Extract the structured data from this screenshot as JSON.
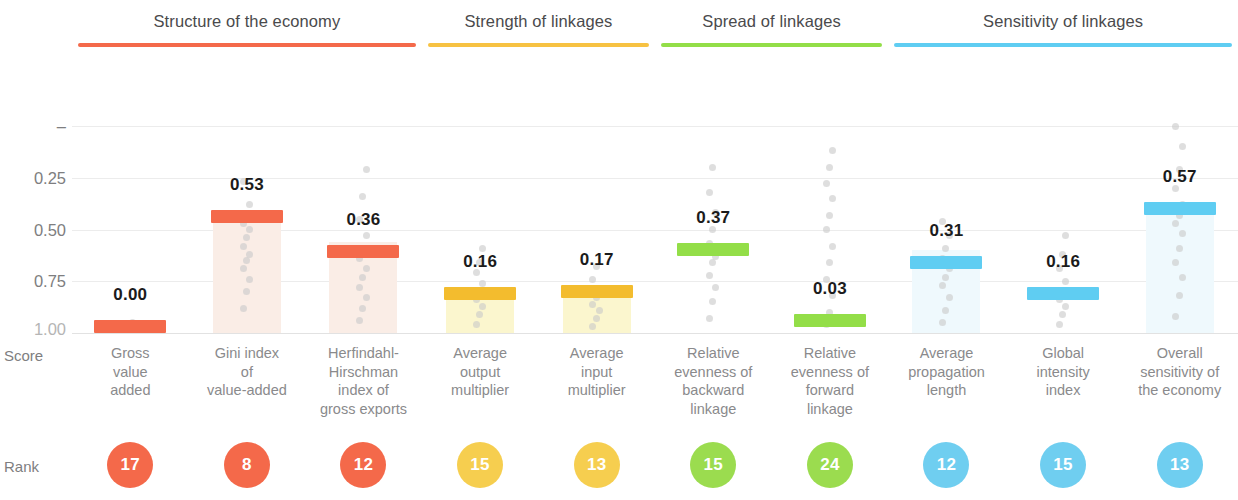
{
  "axis": {
    "score_caption": "Score",
    "rank_caption": "Rank",
    "yticks": [
      "1.00",
      "0.75",
      "0.50",
      "0.25",
      "–"
    ],
    "ytick_values": [
      1.0,
      0.75,
      0.5,
      0.25,
      0.0
    ]
  },
  "groups": [
    {
      "label": "Structure of the economy",
      "color": "#F4694A",
      "span": [
        0,
        2
      ]
    },
    {
      "label": "Strength of linkages",
      "color": "#F7C242",
      "span": [
        3,
        4
      ]
    },
    {
      "label": "Spread of linkages",
      "color": "#93DE48",
      "span": [
        5,
        6
      ]
    },
    {
      "label": "Sensitivity of linkages",
      "color": "#5FCDF2",
      "span": [
        7,
        9
      ]
    }
  ],
  "chart_data": {
    "type": "bar",
    "title": "",
    "xlabel": "",
    "ylabel": "Score",
    "ylim": [
      0,
      1.0
    ],
    "yticks": [
      0.0,
      0.25,
      0.5,
      0.75,
      1.0
    ],
    "grid": true,
    "legend": "none",
    "categories": [
      "Gross value added",
      "Gini index of value-added",
      "Herfindahl-Hirschman index of gross exports",
      "Average output multiplier",
      "Average input multiplier",
      "Relative evenness of backward linkage",
      "Relative evenness of forward linkage",
      "Average propagation length",
      "Global intensity index",
      "Overall sensitivity of the economy"
    ],
    "category_lines": [
      [
        "Gross",
        "value",
        "added"
      ],
      [
        "Gini index",
        "of",
        "value-added"
      ],
      [
        "Herfindahl-",
        "Hirschman",
        "index of",
        "gross exports"
      ],
      [
        "Average",
        "output",
        "multiplier"
      ],
      [
        "Average",
        "input",
        "multiplier"
      ],
      [
        "Relative",
        "evenness of",
        "backward",
        "linkage"
      ],
      [
        "Relative",
        "evenness of",
        "forward",
        "linkage"
      ],
      [
        "Average",
        "propagation",
        "length"
      ],
      [
        "Global",
        "intensity",
        "index"
      ],
      [
        "Overall",
        "sensitivity of",
        "the economy"
      ]
    ],
    "values": [
      0.0,
      0.53,
      0.36,
      0.16,
      0.17,
      0.37,
      0.03,
      0.31,
      0.16,
      0.57
    ],
    "value_labels": [
      "0.00",
      "0.53",
      "0.36",
      "0.16",
      "0.17",
      "0.37",
      "0.03",
      "0.31",
      "0.16",
      "0.57"
    ],
    "ranks": [
      17,
      8,
      12,
      15,
      13,
      15,
      24,
      12,
      15,
      13
    ],
    "rank_labels": [
      "17",
      "8",
      "12",
      "15",
      "13",
      "15",
      "24",
      "12",
      "15",
      "13"
    ],
    "bar_colors": [
      "#F4694A",
      "#F4694A",
      "#F4694A",
      "#F3BC2E",
      "#F3BC2E",
      "#93DE48",
      "#93DE48",
      "#5FCDF2",
      "#5FCDF2",
      "#5FCDF2"
    ],
    "rank_colors": [
      "#F4694A",
      "#F4694A",
      "#F4694A",
      "#F6CE4F",
      "#F6CE4F",
      "#9BDC4F",
      "#9BDC4F",
      "#6FCEF0",
      "#6FCEF0",
      "#6FCEF0"
    ],
    "box_fills": [
      "#FFFFFF",
      "#FAEDE6",
      "#FAEDE6",
      "#FBF6CE",
      "#FBF6CE",
      "#FFFFFF",
      "#FFFFFF",
      "#EFF9FD",
      "#FFFFFF",
      "#EFF9FD"
    ],
    "box_ranges": [
      [
        0.0,
        0.0
      ],
      [
        0.0,
        0.57
      ],
      [
        0.0,
        0.44
      ],
      [
        0.0,
        0.2
      ],
      [
        0.0,
        0.21
      ],
      [
        0.0,
        0.0
      ],
      [
        0.0,
        0.0
      ],
      [
        0.0,
        0.4
      ],
      [
        0.0,
        0.0
      ],
      [
        0.0,
        0.59
      ]
    ],
    "distributions": [
      [
        0.02,
        0.03,
        0.05
      ],
      [
        0.12,
        0.2,
        0.26,
        0.31,
        0.35,
        0.38,
        0.42,
        0.46,
        0.5,
        0.53,
        0.57,
        0.62,
        0.73
      ],
      [
        0.06,
        0.12,
        0.17,
        0.22,
        0.27,
        0.31,
        0.36,
        0.41,
        0.47,
        0.55,
        0.66,
        0.79
      ],
      [
        0.04,
        0.09,
        0.13,
        0.16,
        0.2,
        0.24,
        0.29,
        0.34,
        0.41
      ],
      [
        0.03,
        0.07,
        0.11,
        0.14,
        0.17,
        0.21,
        0.26,
        0.32
      ],
      [
        0.07,
        0.15,
        0.22,
        0.28,
        0.34,
        0.37,
        0.43,
        0.5,
        0.58,
        0.68,
        0.8
      ],
      [
        0.04,
        0.1,
        0.18,
        0.26,
        0.34,
        0.42,
        0.5,
        0.57,
        0.65,
        0.72,
        0.8,
        0.88
      ],
      [
        0.05,
        0.11,
        0.17,
        0.23,
        0.27,
        0.31,
        0.36,
        0.41,
        0.47,
        0.54
      ],
      [
        0.04,
        0.09,
        0.13,
        0.16,
        0.2,
        0.25,
        0.31,
        0.38,
        0.47
      ],
      [
        0.08,
        0.18,
        0.27,
        0.34,
        0.41,
        0.48,
        0.53,
        0.57,
        0.62,
        0.7,
        0.79,
        0.9,
        1.0
      ]
    ]
  }
}
